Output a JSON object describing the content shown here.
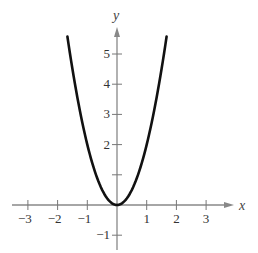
{
  "chart_data": {
    "type": "line",
    "title": "",
    "xlabel": "x",
    "ylabel": "y",
    "function": "y = 2x^2",
    "xlim": [
      -3.5,
      4
    ],
    "ylim": [
      -1.5,
      6
    ],
    "grid": false,
    "legend": null,
    "x_ticks": [
      -3,
      -2,
      -1,
      1,
      2,
      3
    ],
    "y_ticks": [
      -1,
      1,
      2,
      3,
      4,
      5
    ],
    "x_tick_labels": [
      "−3",
      "−2",
      "−1",
      "1",
      "2",
      "3"
    ],
    "y_tick_labels": [
      "−1",
      "",
      "2",
      "3",
      "4",
      "5"
    ],
    "series": [
      {
        "name": "parabola",
        "x": [
          -1.67,
          -1.5,
          -1.25,
          -1,
          -0.75,
          -0.5,
          -0.25,
          0,
          0.25,
          0.5,
          0.75,
          1,
          1.25,
          1.5,
          1.67
        ],
        "y": [
          5.58,
          4.5,
          3.125,
          2,
          1.125,
          0.5,
          0.125,
          0,
          0.125,
          0.5,
          1.125,
          2,
          3.125,
          4.5,
          5.58
        ],
        "color": "#111111"
      }
    ]
  },
  "axes": {
    "x_label": "x",
    "y_label": "y"
  }
}
